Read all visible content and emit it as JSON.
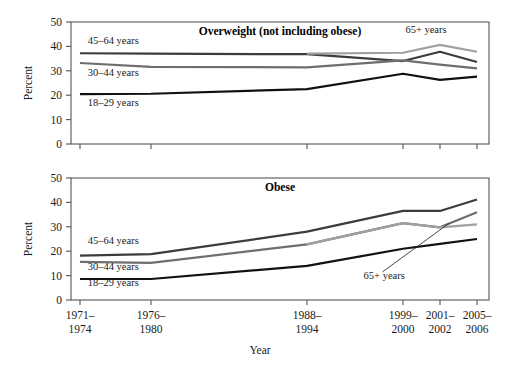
{
  "figure": {
    "xlabel": "Year",
    "ylabel_top": "Percent",
    "ylabel_bottom": "Percent"
  },
  "chart_data": {
    "type": "line",
    "title": "",
    "xlabel": "Year",
    "ylabel": "Percent",
    "ylim": [
      0,
      50
    ],
    "yticks": [
      0,
      10,
      20,
      30,
      40,
      50
    ],
    "grid": false,
    "legend_position": "inline-annotations",
    "categories": [
      "1971–1974",
      "1976–1980",
      "1988–1994",
      "1999–2000",
      "2001–2002",
      "2005–2006"
    ],
    "x_tick_lines": [
      [
        "1971–",
        "1974"
      ],
      [
        "1976–",
        "1980"
      ],
      [
        "1988–",
        "1994"
      ],
      [
        "1999–",
        "2000"
      ],
      [
        "2001–",
        "2002"
      ],
      [
        "2005–",
        "2006"
      ]
    ],
    "panels": [
      {
        "name": "overweight",
        "title": "Overweight (not including obese)",
        "ylabel": "Percent",
        "ylim": [
          0,
          50
        ],
        "series": [
          {
            "name": "45–64 years",
            "color": "#3c3c3c",
            "x": [
              "1971–1974",
              "1976–1980",
              "1988–1994",
              "1999–2000",
              "2001–2002",
              "2005–2006"
            ],
            "values": [
              37.2,
              37.0,
              36.8,
              34.0,
              37.8,
              33.6
            ]
          },
          {
            "name": "30–44 years",
            "color": "#6e6e6e",
            "x": [
              "1971–1974",
              "1976–1980",
              "1988–1994",
              "1999–2000",
              "2001–2002",
              "2005–2006"
            ],
            "values": [
              33.2,
              31.6,
              31.4,
              34.3,
              32.5,
              31.0
            ]
          },
          {
            "name": "18–29 years",
            "color": "#111111",
            "x": [
              "1971–1974",
              "1976–1980",
              "1988–1994",
              "1999–2000",
              "2001–2002",
              "2005–2006"
            ],
            "values": [
              20.4,
              20.6,
              22.5,
              28.8,
              26.3,
              27.6
            ]
          },
          {
            "name": "65+ years",
            "color": "#a0a0a0",
            "x": [
              "1988–1994",
              "1999–2000",
              "2001–2002",
              "2005–2006"
            ],
            "values": [
              37.0,
              37.4,
              40.6,
              37.8
            ]
          }
        ],
        "annotations": [
          {
            "text": "45–64 years",
            "x_pct": 0.04,
            "value": 41.0
          },
          {
            "text": "30–44 years",
            "x_pct": 0.04,
            "value": 28.0
          },
          {
            "text": "18–29 years",
            "x_pct": 0.04,
            "value": 15.5
          },
          {
            "text": "65+ years",
            "x_pct": 0.8,
            "value": 45.5
          }
        ]
      },
      {
        "name": "obese",
        "title": "Obese",
        "ylabel": "Percent",
        "ylim": [
          0,
          50
        ],
        "series": [
          {
            "name": "45–64 years",
            "color": "#3c3c3c",
            "x": [
              "1971–1974",
              "1976–1980",
              "1988–1994",
              "1999–2000",
              "2001–2002",
              "2005–2006"
            ],
            "values": [
              18.2,
              18.8,
              28.0,
              36.5,
              36.5,
              41.2
            ]
          },
          {
            "name": "30–44 years",
            "color": "#6e6e6e",
            "x": [
              "1971–1974",
              "1976–1980",
              "1988–1994",
              "1999–2000",
              "2001–2002",
              "2005–2006"
            ],
            "values": [
              15.6,
              15.2,
              22.8,
              31.5,
              29.8,
              36.0
            ]
          },
          {
            "name": "18–29 years",
            "color": "#111111",
            "x": [
              "1971–1974",
              "1976–1980",
              "1988–1994",
              "1999–2000",
              "2001–2002",
              "2005–2006"
            ],
            "values": [
              8.6,
              8.6,
              14.0,
              21.0,
              23.0,
              25.0
            ]
          },
          {
            "name": "65+ years",
            "color": "#a0a0a0",
            "x": [
              "1988–1994",
              "1999–2000",
              "2001–2002",
              "2005–2006"
            ],
            "values": [
              22.8,
              31.5,
              29.8,
              31.0
            ]
          }
        ],
        "annotations": [
          {
            "text": "45–64 years",
            "x_pct": 0.04,
            "value": 23.0
          },
          {
            "text": "30–44 years",
            "x_pct": 0.04,
            "value": 12.5
          },
          {
            "text": "18–29 years",
            "x_pct": 0.04,
            "value": 5.6
          },
          {
            "text": "65+ years",
            "x_pct": 0.7,
            "value": 8.5
          }
        ],
        "leader_line": {
          "from_x_pct": 0.745,
          "from_value": 11.5,
          "to_x_pct": 0.905,
          "to_value": 31.5
        }
      }
    ]
  }
}
